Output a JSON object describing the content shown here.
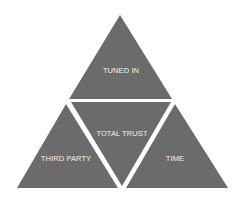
{
  "diagram": {
    "title": "",
    "colors": {
      "background": "#ffffff",
      "segment_fill": "#6b6b6b",
      "label_text": "#f2f2f2"
    },
    "segments": [
      {
        "id": "top",
        "label": "TUNED IN"
      },
      {
        "id": "center",
        "label": "TOTAL TRUST"
      },
      {
        "id": "bottom-left",
        "label": "THIRD PARTY"
      },
      {
        "id": "bottom-right",
        "label": "TIME"
      }
    ]
  }
}
